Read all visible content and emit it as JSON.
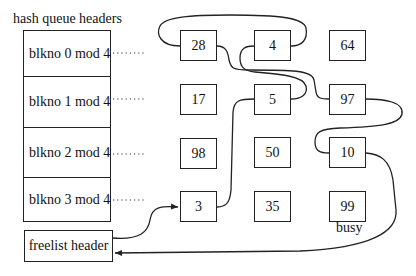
{
  "title": "hash queue headers",
  "hash_queue_headers": [
    {
      "label": "blkno 0 mod 4"
    },
    {
      "label": "blkno 1 mod 4"
    },
    {
      "label": "blkno 2 mod 4"
    },
    {
      "label": "blkno 3 mod 4"
    }
  ],
  "freelist": {
    "label": "freelist header"
  },
  "buffers": [
    {
      "row": 0,
      "col": 0,
      "blkno": "28"
    },
    {
      "row": 0,
      "col": 1,
      "blkno": "4"
    },
    {
      "row": 0,
      "col": 2,
      "blkno": "64"
    },
    {
      "row": 1,
      "col": 0,
      "blkno": "17"
    },
    {
      "row": 1,
      "col": 1,
      "blkno": "5"
    },
    {
      "row": 1,
      "col": 2,
      "blkno": "97"
    },
    {
      "row": 2,
      "col": 0,
      "blkno": "98"
    },
    {
      "row": 2,
      "col": 1,
      "blkno": "50"
    },
    {
      "row": 2,
      "col": 2,
      "blkno": "10"
    },
    {
      "row": 3,
      "col": 0,
      "blkno": "3"
    },
    {
      "row": 3,
      "col": 1,
      "blkno": "35"
    },
    {
      "row": 3,
      "col": 2,
      "blkno": "99"
    }
  ],
  "annotations": {
    "busy": "busy"
  },
  "free_list_order": [
    "3",
    "5",
    "4",
    "28",
    "97",
    "10"
  ]
}
